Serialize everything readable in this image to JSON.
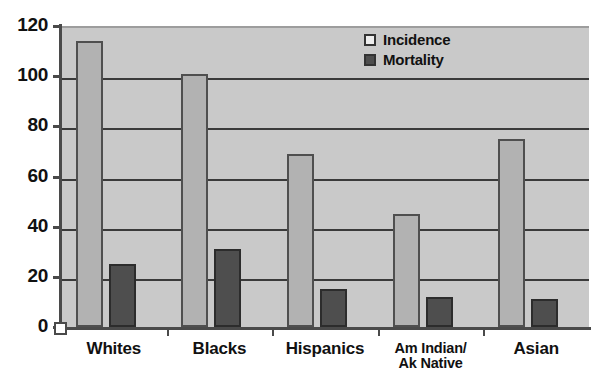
{
  "chart_data": {
    "type": "bar",
    "title": "",
    "subtitle": "",
    "xlabel": "",
    "ylabel": "",
    "ylim": [
      0,
      120
    ],
    "ytick_labels": [
      "120",
      "100",
      "80",
      "60",
      "40",
      "20",
      "0"
    ],
    "yticks": [
      120,
      100,
      80,
      60,
      40,
      20,
      0
    ],
    "grid": true,
    "grid_axis": "y",
    "legend_position": "top-right-inside",
    "categories": [
      "Whites",
      "Blacks",
      "Hispanics",
      "Am Indian/ Ak Native",
      "Asian"
    ],
    "category_labels": [
      {
        "line1": "Whites",
        "line2": ""
      },
      {
        "line1": "Blacks",
        "line2": ""
      },
      {
        "line1": "Hispanics",
        "line2": ""
      },
      {
        "line1": "Am Indian/",
        "line2": "Ak Native"
      },
      {
        "line1": "Asian",
        "line2": ""
      }
    ],
    "series": [
      {
        "name": "Incidence",
        "color": "#b2b2b2",
        "values": [
          114,
          101,
          69,
          45,
          75
        ]
      },
      {
        "name": "Mortality",
        "color": "#4e4e4e",
        "values": [
          25,
          31,
          15,
          12,
          11
        ]
      }
    ]
  },
  "legend": {
    "items": [
      {
        "label": "Incidence",
        "swatch": "incidence-swatch"
      },
      {
        "label": "Mortality",
        "swatch": "mortality-swatch"
      }
    ]
  },
  "colors": {
    "plot_background": "#c9c9c9",
    "page_background": "#ffffff",
    "gridline": "#3a3a3a",
    "axis": "#4a4a4a",
    "incidence": "#b2b2b2",
    "mortality": "#4e4e4e",
    "text": "#111111"
  }
}
